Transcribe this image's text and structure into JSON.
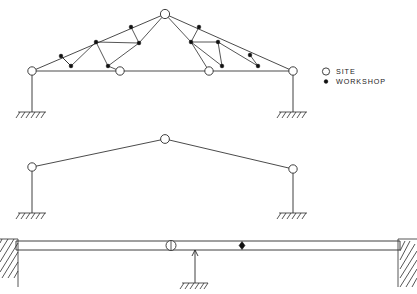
{
  "figure": {
    "type": "structural-connection-diagram",
    "background_color": "#ffffff",
    "line_color": "#2b2b2b",
    "marker_fill_site": "#ffffff",
    "marker_fill_workshop": "#111111"
  },
  "legend": {
    "name": "joint-type-legend",
    "items": [
      {
        "marker": "open-circle",
        "label": "SITE"
      },
      {
        "marker": "filled-dot",
        "label": "WORKSHOP"
      }
    ],
    "x": 322,
    "y": 71
  },
  "diagrams": [
    {
      "id": "truss-diagram",
      "name": "pitched-lattice-truss",
      "description": "Pitched roof lattice truss with web members, supported on two columns with fixed ground supports",
      "span_left_x": 32,
      "span_right_x": 293,
      "bottom_chord_y": 71,
      "apex_x": 165,
      "apex_y": 14,
      "site_joints": [
        {
          "x": 32,
          "y": 71
        },
        {
          "x": 120,
          "y": 71
        },
        {
          "x": 209,
          "y": 71
        },
        {
          "x": 293,
          "y": 71
        },
        {
          "x": 165,
          "y": 14
        }
      ],
      "workshop_joints": [
        {
          "x": 61,
          "y": 56
        },
        {
          "x": 71,
          "y": 66
        },
        {
          "x": 96,
          "y": 42
        },
        {
          "x": 108,
          "y": 66
        },
        {
          "x": 131,
          "y": 27
        },
        {
          "x": 139,
          "y": 43
        },
        {
          "x": 191,
          "y": 42
        },
        {
          "x": 199,
          "y": 27
        },
        {
          "x": 218,
          "y": 42
        },
        {
          "x": 222,
          "y": 66
        },
        {
          "x": 250,
          "y": 55
        },
        {
          "x": 258,
          "y": 66
        }
      ],
      "columns": [
        {
          "x": 32,
          "top_y": 71,
          "bottom_y": 112
        },
        {
          "x": 293,
          "top_y": 71,
          "bottom_y": 112
        }
      ],
      "ground_supports": [
        {
          "x": 32,
          "y": 112,
          "half_width": 14
        },
        {
          "x": 293,
          "y": 112,
          "half_width": 14
        }
      ]
    },
    {
      "id": "portal-frame-diagram",
      "name": "simple-pitched-portal-frame",
      "description": "Simple pitched portal frame with apex joint and two eaves joints on columns with fixed ground supports",
      "left_eaves": {
        "x": 32,
        "y": 167
      },
      "apex": {
        "x": 165,
        "y": 139
      },
      "right_eaves": {
        "x": 293,
        "y": 169
      },
      "site_joints": [
        {
          "x": 32,
          "y": 167
        },
        {
          "x": 165,
          "y": 139
        },
        {
          "x": 293,
          "y": 169
        }
      ],
      "workshop_joints": [],
      "columns": [
        {
          "x": 32,
          "top_y": 167,
          "bottom_y": 213
        },
        {
          "x": 293,
          "top_y": 169,
          "bottom_y": 213
        }
      ],
      "ground_supports": [
        {
          "x": 32,
          "y": 213,
          "half_width": 14
        },
        {
          "x": 293,
          "y": 213,
          "half_width": 14
        }
      ]
    },
    {
      "id": "continuous-beam-diagram",
      "name": "continuous-beam-on-walls-and-prop",
      "description": "Continuous beam seated on two hatched masonry end walls with a central propping column on a fixed ground support; one site splice joint and one workshop joint along the beam",
      "beam_left_x": 18,
      "beam_right_x": 398,
      "beam_top_y": 241,
      "beam_bottom_y": 250,
      "site_joints": [
        {
          "x": 171,
          "y": 245
        }
      ],
      "workshop_joints": [
        {
          "x": 242,
          "y": 245
        }
      ],
      "prop_column": {
        "x": 195,
        "top_y": 250,
        "bottom_y": 283
      },
      "ground_supports": [
        {
          "x": 195,
          "y": 283,
          "half_width": 13
        }
      ],
      "end_walls": [
        {
          "side": "left",
          "inner_x": 18,
          "outer_x": 0,
          "top_y": 239,
          "bottom_y": 287
        },
        {
          "side": "right",
          "inner_x": 398,
          "outer_x": 417,
          "top_y": 239,
          "bottom_y": 287
        }
      ]
    }
  ]
}
